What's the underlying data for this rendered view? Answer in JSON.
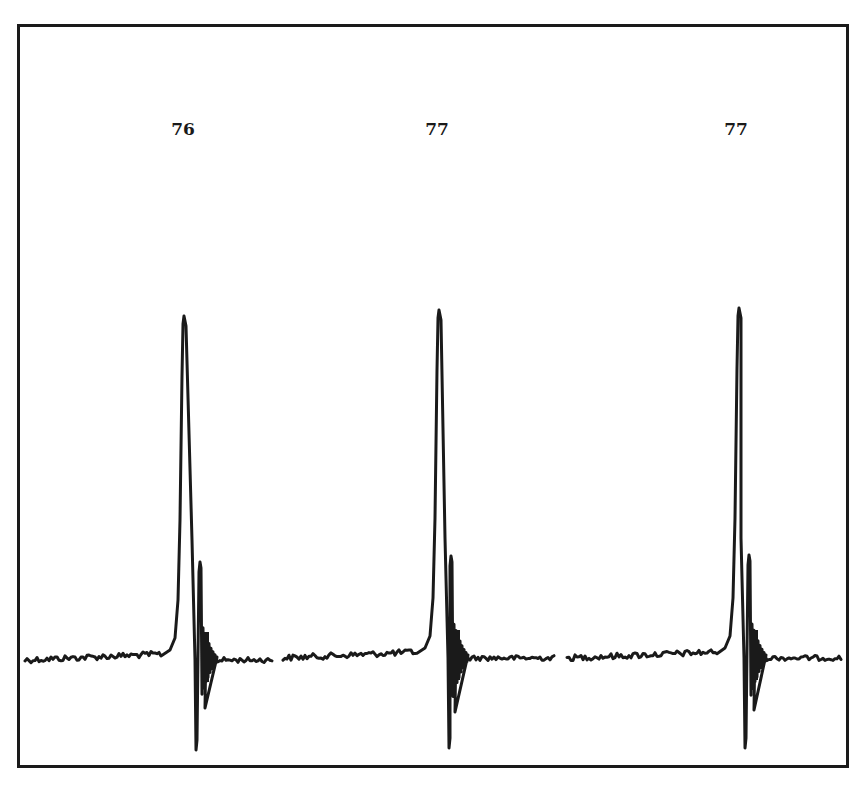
{
  "chart_data": {
    "type": "line",
    "title": "",
    "xlabel": "",
    "ylabel": "",
    "grid": false,
    "legend": null,
    "annotations": [
      {
        "text": "76",
        "x_px": 183,
        "y_px": 131
      },
      {
        "text": "77",
        "x_px": 437,
        "y_px": 131
      },
      {
        "text": "77",
        "x_px": 736,
        "y_px": 131
      }
    ],
    "series": [
      {
        "name": "trace-1",
        "label": "76",
        "x_range_px": [
          25,
          273
        ],
        "baseline_y_px": 660,
        "peak": {
          "x_px": 184,
          "y_px": 316
        },
        "trough": {
          "x_px": 196,
          "y_px": 750
        },
        "ringing_max": {
          "x_px": 200,
          "y_px": 562
        },
        "ringing_min": {
          "x_px": 205,
          "y_px": 708
        }
      },
      {
        "name": "trace-2",
        "label": "77",
        "x_range_px": [
          283,
          555
        ],
        "baseline_y_px": 658,
        "peak": {
          "x_px": 439,
          "y_px": 310
        },
        "trough": {
          "x_px": 449,
          "y_px": 748
        },
        "ringing_max": {
          "x_px": 451,
          "y_px": 556
        },
        "ringing_min": {
          "x_px": 455,
          "y_px": 712
        }
      },
      {
        "name": "trace-3",
        "label": "77",
        "x_range_px": [
          567,
          842
        ],
        "baseline_y_px": 658,
        "peak": {
          "x_px": 739,
          "y_px": 308
        },
        "trough": {
          "x_px": 745,
          "y_px": 748
        },
        "ringing_max": {
          "x_px": 749,
          "y_px": 555
        },
        "ringing_min": {
          "x_px": 754,
          "y_px": 710
        }
      }
    ]
  },
  "labels": {
    "spike_1": "76",
    "spike_2": "77",
    "spike_3": "77"
  },
  "colors": {
    "ink": "#1a1a1a",
    "background": "#ffffff"
  }
}
